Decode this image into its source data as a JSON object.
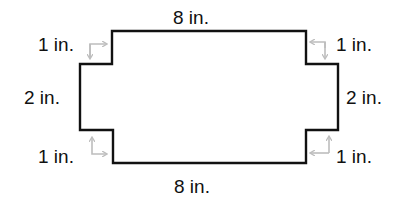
{
  "diagram": {
    "type": "polygon-dimensions",
    "shape": "rectangle with notched corners (cross shape)",
    "colors": {
      "outline": "#111111",
      "arrows": "#bdbdbd",
      "text": "#111111"
    },
    "labels": {
      "top": "8 in.",
      "bottom": "8 in.",
      "left": "2 in.",
      "right": "2 in.",
      "top_left_notch": "1 in.",
      "top_right_notch": "1 in.",
      "bottom_left_notch": "1 in.",
      "bottom_right_notch": "1 in."
    }
  }
}
